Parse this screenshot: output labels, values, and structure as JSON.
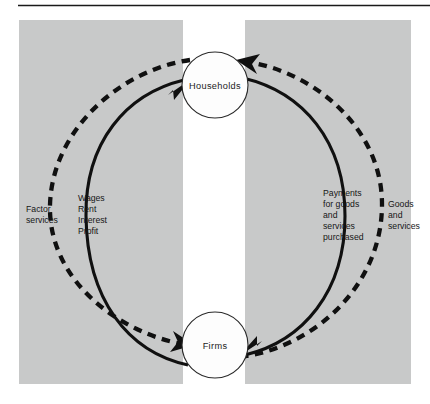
{
  "figure": {
    "background_color": "#ffffff",
    "panel_color": "#c8c9c9",
    "ink_color": "#101010"
  },
  "nodes": {
    "households": {
      "label": "Households"
    },
    "firms": {
      "label": "Firms"
    }
  },
  "flows": {
    "factor_services": {
      "lines": [
        "Factor",
        "services"
      ],
      "line1": "Factor",
      "line2": "services",
      "style": "dashed",
      "direction": "households-to-firms"
    },
    "incomes": {
      "lines": [
        "Wages",
        "Rent",
        "Interest",
        "Profit"
      ],
      "line1": "Wages",
      "line2": "Rent",
      "line3": "Interest",
      "line4": "Profit",
      "style": "solid",
      "direction": "firms-to-households"
    },
    "payments": {
      "lines": [
        "Payments",
        "for goods",
        "and",
        "services",
        "purchased"
      ],
      "line1": "Payments",
      "line2": "for goods",
      "line3": "and",
      "line4": "services",
      "line5": "purchased",
      "style": "solid",
      "direction": "households-to-firms"
    },
    "goods_and_services": {
      "lines": [
        "Goods",
        "and",
        "services"
      ],
      "line1": "Goods",
      "line2": "and",
      "line3": "services",
      "style": "dashed",
      "direction": "firms-to-households"
    }
  }
}
